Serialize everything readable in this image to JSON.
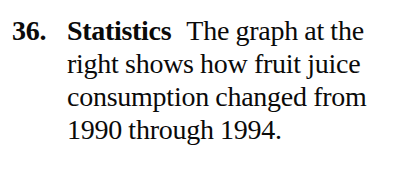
{
  "exercise": {
    "number": "36.",
    "label": "Statistics",
    "text": "The graph at the right shows how fruit juice consumption changed from 1990 through 1994.",
    "lines": [
      "The graph at",
      "the right shows how fruit",
      "juice consumption",
      "changed from 1990",
      "through 1994."
    ],
    "text_color": "#0a0a0a",
    "background_color": "#ffffff",
    "years_mentioned": [
      "1990",
      "1994"
    ],
    "topic": "fruit juice consumption"
  }
}
